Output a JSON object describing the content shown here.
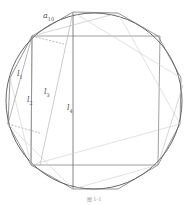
{
  "figure": {
    "caption": "图 1-1",
    "colors": {
      "circle": "#555555",
      "dark_line": "#666666",
      "light_line": "#bbbbbb",
      "dashed": "#888888",
      "label": "#555555"
    },
    "labels": [
      {
        "id": "a10",
        "base": "a",
        "sub": "10",
        "x": 43,
        "y": 12
      },
      {
        "id": "l1",
        "base": "l",
        "sub": "1",
        "x": 17,
        "y": 70
      },
      {
        "id": "l2",
        "base": "l",
        "sub": "2",
        "x": 27,
        "y": 96
      },
      {
        "id": "l3",
        "base": "l",
        "sub": "3",
        "x": 44,
        "y": 88
      },
      {
        "id": "l4",
        "base": "l",
        "sub": "4",
        "x": 67,
        "y": 104
      }
    ]
  }
}
